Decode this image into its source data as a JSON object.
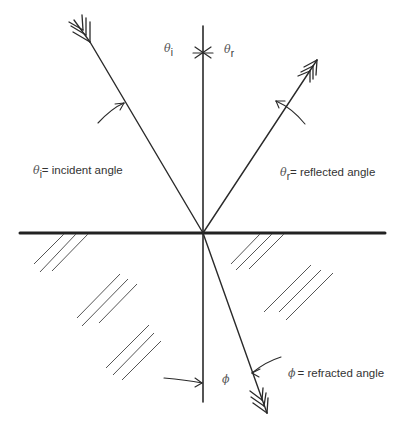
{
  "diagram": {
    "colors": {
      "line": "#2a2a2a",
      "surface": "#222222",
      "hatch": "#555555",
      "text": "#333333"
    },
    "angles": {
      "incident_symbol": "θ",
      "incident_subscript": "i",
      "reflected_symbol": "θ",
      "reflected_subscript": "r",
      "refracted_symbol": "ϕ"
    },
    "legend": {
      "incident": {
        "symbol": "θ",
        "subscript": "i",
        "text": "= incident angle"
      },
      "reflected": {
        "symbol": "θ",
        "subscript": "r",
        "text": "= reflected angle"
      },
      "refracted": {
        "symbol": "ϕ",
        "text": "= refracted angle"
      }
    },
    "elements": {
      "normal": "normal-line",
      "surface": "interface-surface",
      "incident_ray": "incident-ray",
      "reflected_ray": "reflected-ray",
      "refracted_ray": "refracted-ray"
    }
  }
}
